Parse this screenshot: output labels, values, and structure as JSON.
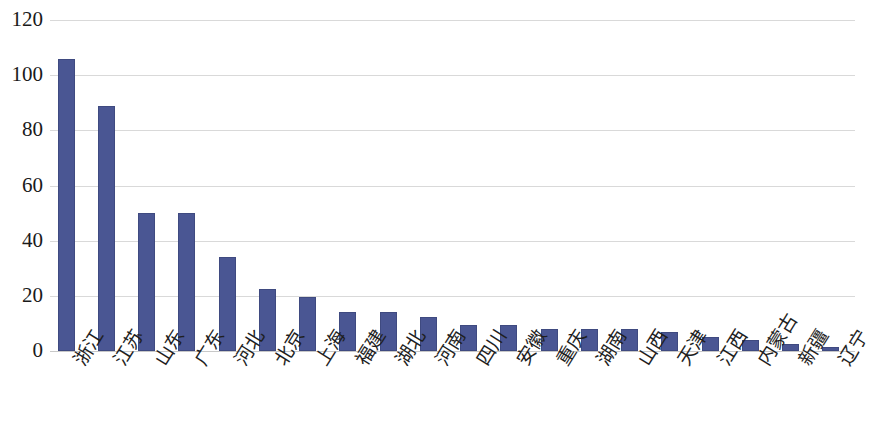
{
  "chart_data": {
    "type": "bar",
    "title": "",
    "subtitle": "",
    "xlabel": "",
    "ylabel": "",
    "ylim": [
      0,
      120
    ],
    "yticks": [
      0,
      20,
      40,
      60,
      80,
      100,
      120
    ],
    "ytick_labels": [
      "0",
      "20",
      "40",
      "60",
      "80",
      "100",
      "120"
    ],
    "grid": true,
    "legend": false,
    "legend_position": "none",
    "bar_color": "#4a5693",
    "bar_border_color": "#3f4a80",
    "gridline_color": "#d9d9d9",
    "axis_color": "#c8c8c8",
    "background_color": "#ffffff",
    "categories": [
      "浙江",
      "江苏",
      "山东",
      "广东",
      "河北",
      "北京",
      "上海",
      "福建",
      "湖北",
      "河南",
      "四川",
      "安徽",
      "重庆",
      "湖南",
      "山西",
      "天津",
      "江西",
      "内蒙古",
      "新疆",
      "辽宁"
    ],
    "values": [
      106,
      89,
      50,
      50,
      34,
      22.5,
      19.5,
      14,
      14,
      12.5,
      9.5,
      9.5,
      8,
      8,
      8,
      7,
      5,
      4,
      2.5,
      1.5
    ],
    "series": [
      {
        "name": "",
        "values": [
          106,
          89,
          50,
          50,
          34,
          22.5,
          19.5,
          14,
          14,
          12.5,
          9.5,
          9.5,
          8,
          8,
          8,
          7,
          5,
          4,
          2.5,
          1.5
        ]
      }
    ]
  }
}
